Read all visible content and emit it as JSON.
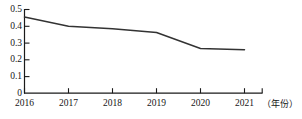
{
  "chart_data": {
    "type": "line",
    "title": "",
    "xlabel": "（年份）",
    "ylabel": "",
    "categories": [
      "2016",
      "2017",
      "2018",
      "2019",
      "2020",
      "2021"
    ],
    "x": [
      2016,
      2017,
      2018,
      2019,
      2020,
      2021
    ],
    "values": [
      0.455,
      0.4,
      0.385,
      0.363,
      0.267,
      0.259
    ],
    "series": [
      {
        "name": "",
        "values": [
          0.455,
          0.4,
          0.385,
          0.363,
          0.267,
          0.259
        ]
      }
    ],
    "ylim": [
      0,
      0.5
    ],
    "ytick_labels": [
      "0.5",
      "0.4",
      "0.3",
      "0.2",
      "0.1",
      "0"
    ],
    "ytick_values": [
      0.5,
      0.4,
      0.3,
      0.2,
      0.1,
      0
    ],
    "xtick_labels": [
      "2016",
      "2017",
      "2018",
      "2019",
      "2020",
      "2021"
    ],
    "grid": false,
    "legend": false,
    "legend_position": "none",
    "line_color": "#333333",
    "axis_color": "#1a1a1a",
    "background_color": "#ffffff"
  }
}
